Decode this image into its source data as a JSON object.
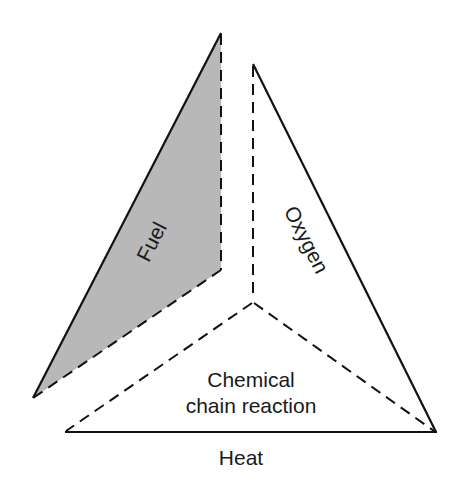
{
  "diagram": {
    "type": "fire-tetrahedron",
    "faces": [
      {
        "id": "fuel",
        "label": "Fuel",
        "fill": "#b8b8b8"
      },
      {
        "id": "oxygen",
        "label": "Oxygen",
        "fill": "#ffffff"
      },
      {
        "id": "heat",
        "label": "Heat",
        "fill": "#ffffff"
      },
      {
        "id": "chain",
        "label_line1": "Chemical",
        "label_line2": "chain reaction",
        "fill": "#ffffff"
      }
    ],
    "colors": {
      "stroke": "#111111",
      "fuel_fill": "#b8b8b8",
      "background": "#ffffff"
    }
  }
}
